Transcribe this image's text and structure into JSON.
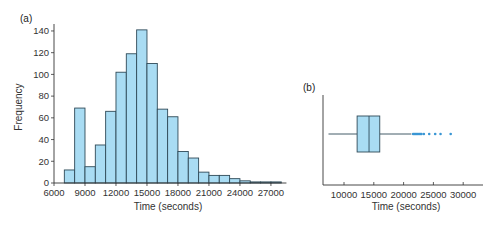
{
  "colors": {
    "bar_fill": "#a9dcf3",
    "bar_edge": "#2f4a58",
    "axis": "#333333",
    "outlier": "#3a96d4",
    "box_fill": "#a9dcf3"
  },
  "chart_data": [
    {
      "panel_label": "(a)",
      "type": "bar",
      "subtype": "histogram",
      "title": "",
      "xlabel": "Time (seconds)",
      "ylabel": "Frequency",
      "xlim": [
        6000,
        28500
      ],
      "ylim": [
        0,
        150
      ],
      "x_ticks": [
        6000,
        9000,
        12000,
        15000,
        18000,
        21000,
        24000,
        27000
      ],
      "x_tick_labels": [
        "6000",
        "9000",
        "12000",
        "15000",
        "18000",
        "21000",
        "24000",
        "27000"
      ],
      "y_ticks": [
        0,
        20,
        40,
        60,
        80,
        100,
        120,
        140
      ],
      "y_tick_labels": [
        "0",
        "20",
        "40",
        "60",
        "80",
        "100",
        "120",
        "140"
      ],
      "bin_width": 1000,
      "bins": [
        {
          "start": 7000,
          "end": 8000,
          "count": 12
        },
        {
          "start": 8000,
          "end": 9000,
          "count": 69
        },
        {
          "start": 9000,
          "end": 10000,
          "count": 15
        },
        {
          "start": 10000,
          "end": 11000,
          "count": 35
        },
        {
          "start": 11000,
          "end": 12000,
          "count": 66
        },
        {
          "start": 12000,
          "end": 13000,
          "count": 102
        },
        {
          "start": 13000,
          "end": 14000,
          "count": 119
        },
        {
          "start": 14000,
          "end": 15000,
          "count": 141
        },
        {
          "start": 15000,
          "end": 16000,
          "count": 110
        },
        {
          "start": 16000,
          "end": 17000,
          "count": 68
        },
        {
          "start": 17000,
          "end": 18000,
          "count": 61
        },
        {
          "start": 18000,
          "end": 19000,
          "count": 29
        },
        {
          "start": 19000,
          "end": 20000,
          "count": 23
        },
        {
          "start": 20000,
          "end": 21000,
          "count": 10
        },
        {
          "start": 21000,
          "end": 22000,
          "count": 7
        },
        {
          "start": 22000,
          "end": 23000,
          "count": 7
        },
        {
          "start": 23000,
          "end": 24000,
          "count": 4
        },
        {
          "start": 24000,
          "end": 25000,
          "count": 2
        },
        {
          "start": 25000,
          "end": 26000,
          "count": 1
        },
        {
          "start": 26000,
          "end": 27000,
          "count": 1
        },
        {
          "start": 27000,
          "end": 28000,
          "count": 1
        }
      ],
      "grid": false,
      "legend": null
    },
    {
      "panel_label": "(b)",
      "type": "box",
      "orientation": "horizontal",
      "title": "",
      "xlabel": "Time (seconds)",
      "ylabel": "",
      "xlim": [
        6500,
        32000
      ],
      "x_ticks": [
        10000,
        15000,
        20000,
        25000,
        30000
      ],
      "x_tick_labels": [
        "10000",
        "15000",
        "20000",
        "25000",
        "30000"
      ],
      "whisker_low": 7400,
      "q1": 12200,
      "median": 14200,
      "q3": 16000,
      "whisker_high": 21300,
      "outliers": [
        21600,
        21800,
        22000,
        22200,
        22400,
        22600,
        22800,
        23000,
        23400,
        24300,
        25300,
        26200,
        27900
      ],
      "grid": false,
      "legend": null
    }
  ]
}
